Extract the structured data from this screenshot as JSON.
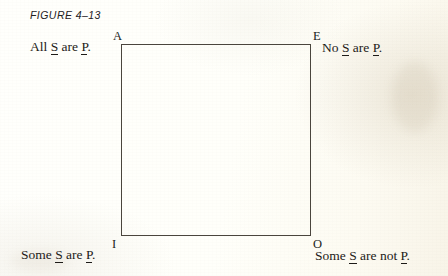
{
  "figure": {
    "caption": "FIGURE 4–13",
    "type": "square-of-opposition"
  },
  "square": {
    "left": 121,
    "top": 44,
    "width": 190,
    "height": 192,
    "stroke_color": "#4a453d"
  },
  "corners": {
    "a": "A",
    "e": "E",
    "i": "I",
    "o": "O"
  },
  "propositions": {
    "a": {
      "prefix": "All ",
      "subject": "S",
      "middle": " are ",
      "predicate": "P",
      "suffix": "."
    },
    "e": {
      "prefix": "No ",
      "subject": "S",
      "middle": " are ",
      "predicate": "P",
      "suffix": "."
    },
    "i": {
      "prefix": "Some ",
      "subject": "S",
      "middle": " are ",
      "predicate": "P",
      "suffix": "."
    },
    "o": {
      "prefix": "Some ",
      "subject": "S",
      "middle": " are not ",
      "predicate": "P",
      "suffix": "."
    }
  },
  "colors": {
    "paper": "#fffffb",
    "ink": "#1d1b18",
    "rule": "#4a453d"
  }
}
